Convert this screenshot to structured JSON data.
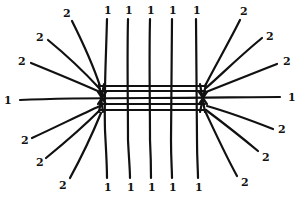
{
  "diagram": {
    "stroke_color": "#111111",
    "background": "#ffffff",
    "labels": {
      "top_ones": [
        "1",
        "1",
        "1",
        "1",
        "1"
      ],
      "bottom_ones": [
        "1",
        "1",
        "1",
        "1",
        "1"
      ],
      "left_one": "1",
      "right_one": "1",
      "top_left_twos": [
        "2",
        "2",
        "2"
      ],
      "bottom_left_twos": [
        "2",
        "2",
        "2"
      ],
      "top_right_twos": [
        "2",
        "2",
        "2"
      ],
      "bottom_right_twos": [
        "2",
        "2",
        "2"
      ]
    }
  }
}
